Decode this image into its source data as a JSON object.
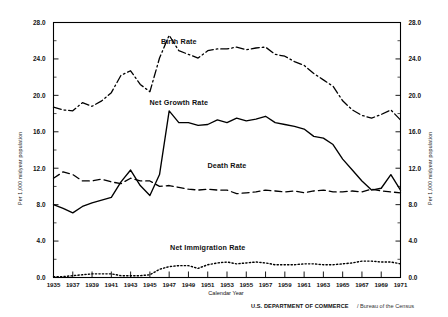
{
  "figure": {
    "credit_bold": "U.S. DEPARTMENT OF COMMERCE",
    "credit_sep": "/",
    "credit_light": "Bureau of the Census"
  },
  "chart_data": {
    "type": "line",
    "title": "",
    "xlabel": "Calendar Year",
    "ylabel": "Per 1,000 midyear population",
    "ylabel_right": "Per 1,000 midyear population",
    "xlim": [
      1935,
      1971
    ],
    "ylim": [
      0.0,
      28.0
    ],
    "grid": false,
    "legend_position": "inline-annotations",
    "ytick_labels": [
      "0.0",
      "4.0",
      "8.0",
      "12.0",
      "16.0",
      "20.0",
      "24.0",
      "28.0"
    ],
    "ytick_values": [
      0.0,
      4.0,
      8.0,
      12.0,
      16.0,
      20.0,
      24.0,
      28.0
    ],
    "ytick_labels_right": [
      "0.0",
      "4.0",
      "8.0",
      "12.0",
      "16.0",
      "20.0",
      "24.0",
      "28.0"
    ],
    "xtick_labels": [
      "1935",
      "1937",
      "1939",
      "1941",
      "1943",
      "1945",
      "1947",
      "1949",
      "1951",
      "1953",
      "1955",
      "1957",
      "1959",
      "1961",
      "1963",
      "1965",
      "1967",
      "1969",
      "1971"
    ],
    "xtick_values": [
      1935,
      1937,
      1939,
      1941,
      1943,
      1945,
      1947,
      1949,
      1951,
      1953,
      1955,
      1957,
      1959,
      1961,
      1963,
      1965,
      1967,
      1969,
      1971
    ],
    "x": [
      1935,
      1936,
      1937,
      1938,
      1939,
      1940,
      1941,
      1942,
      1943,
      1944,
      1945,
      1946,
      1947,
      1948,
      1949,
      1950,
      1951,
      1952,
      1953,
      1954,
      1955,
      1956,
      1957,
      1958,
      1959,
      1960,
      1961,
      1962,
      1963,
      1964,
      1965,
      1966,
      1967,
      1968,
      1969,
      1970,
      1971
    ],
    "series": [
      {
        "name": "Birth Rate",
        "style": "dash-dot",
        "label_x": 1948,
        "label_y": 25.6,
        "values": [
          18.7,
          18.4,
          18.3,
          19.2,
          18.8,
          19.4,
          20.3,
          22.2,
          22.7,
          21.2,
          20.4,
          24.1,
          26.6,
          24.9,
          24.5,
          24.1,
          24.9,
          25.1,
          25.1,
          25.3,
          25.0,
          25.2,
          25.3,
          24.5,
          24.3,
          23.7,
          23.3,
          22.4,
          21.7,
          21.0,
          19.4,
          18.4,
          17.8,
          17.5,
          17.9,
          18.4,
          17.3
        ]
      },
      {
        "name": "Net Growth Rate",
        "style": "solid",
        "label_x": 1948,
        "label_y": 18.9,
        "values": [
          8.0,
          7.6,
          7.1,
          7.8,
          8.2,
          8.5,
          8.8,
          10.5,
          11.8,
          10.1,
          9.0,
          11.3,
          18.3,
          17.0,
          17.0,
          16.7,
          16.8,
          17.3,
          17.0,
          17.5,
          17.2,
          17.4,
          17.7,
          17.0,
          16.8,
          16.6,
          16.3,
          15.5,
          15.3,
          14.6,
          13.0,
          11.8,
          10.6,
          9.6,
          9.8,
          11.3,
          9.6
        ]
      },
      {
        "name": "Death Rate",
        "style": "dashed",
        "label_x": 1953,
        "label_y": 12.0,
        "values": [
          10.9,
          11.6,
          11.3,
          10.6,
          10.6,
          10.8,
          10.5,
          10.3,
          10.9,
          10.6,
          10.6,
          10.0,
          10.1,
          9.9,
          9.7,
          9.6,
          9.7,
          9.6,
          9.6,
          9.2,
          9.3,
          9.4,
          9.6,
          9.5,
          9.4,
          9.5,
          9.3,
          9.5,
          9.6,
          9.4,
          9.4,
          9.5,
          9.4,
          9.7,
          9.5,
          9.4,
          9.3
        ]
      },
      {
        "name": "Net Immigration Rate",
        "style": "dotted",
        "label_x": 1951,
        "label_y": 3.0,
        "values": [
          0.1,
          0.1,
          0.2,
          0.3,
          0.4,
          0.4,
          0.4,
          0.2,
          0.2,
          0.2,
          0.3,
          0.9,
          1.2,
          1.3,
          1.3,
          1.0,
          1.4,
          1.6,
          1.7,
          1.5,
          1.6,
          1.7,
          1.6,
          1.4,
          1.4,
          1.4,
          1.5,
          1.5,
          1.4,
          1.4,
          1.5,
          1.6,
          1.8,
          1.8,
          1.7,
          1.7,
          1.5
        ]
      }
    ]
  }
}
